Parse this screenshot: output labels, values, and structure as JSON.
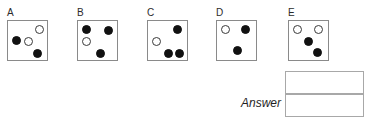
{
  "puzzle": {
    "type": "nonverbal-reasoning-multiple-choice",
    "colors": {
      "black_dot": "#111111",
      "white_dot_fill": "#ffffff",
      "white_dot_stroke": "#3a3a3a",
      "box_border": "#8a8a8a",
      "answer_border": "#a8a8a8",
      "background": "#ffffff",
      "label_text": "#2b2b2b"
    },
    "options": [
      {
        "label": "A",
        "left": 7,
        "dots": [
          {
            "name": "dot-white-top-right",
            "color": "white",
            "x": 27,
            "y": 4
          },
          {
            "name": "dot-black-mid-left",
            "color": "black",
            "x": 4,
            "y": 15
          },
          {
            "name": "dot-white-mid-center",
            "color": "white",
            "x": 16,
            "y": 16
          },
          {
            "name": "dot-black-bottom-right",
            "color": "black",
            "x": 25,
            "y": 28
          }
        ]
      },
      {
        "label": "B",
        "left": 77,
        "dots": [
          {
            "name": "dot-black-top-left",
            "color": "black",
            "x": 4,
            "y": 4
          },
          {
            "name": "dot-black-top-right",
            "color": "black",
            "x": 26,
            "y": 5
          },
          {
            "name": "dot-white-mid-left",
            "color": "white",
            "x": 4,
            "y": 16
          },
          {
            "name": "dot-black-bottom-center",
            "color": "black",
            "x": 18,
            "y": 28
          }
        ]
      },
      {
        "label": "C",
        "left": 147,
        "dots": [
          {
            "name": "dot-black-top-right",
            "color": "black",
            "x": 25,
            "y": 4
          },
          {
            "name": "dot-white-mid-left",
            "color": "white",
            "x": 4,
            "y": 16
          },
          {
            "name": "dot-black-bottom-left",
            "color": "black",
            "x": 16,
            "y": 28
          },
          {
            "name": "dot-black-bottom-right",
            "color": "black",
            "x": 27,
            "y": 28
          }
        ]
      },
      {
        "label": "D",
        "left": 216,
        "dots": [
          {
            "name": "dot-white-top-left",
            "color": "white",
            "x": 4,
            "y": 4
          },
          {
            "name": "dot-black-top-right",
            "color": "black",
            "x": 24,
            "y": 4
          },
          {
            "name": "dot-black-bottom-center",
            "color": "black",
            "x": 16,
            "y": 25
          }
        ]
      },
      {
        "label": "E",
        "left": 288,
        "dots": [
          {
            "name": "dot-white-top-left",
            "color": "white",
            "x": 4,
            "y": 4
          },
          {
            "name": "dot-white-top-right",
            "color": "white",
            "x": 25,
            "y": 4
          },
          {
            "name": "dot-black-center",
            "color": "black",
            "x": 15,
            "y": 16
          },
          {
            "name": "dot-black-bottom-right",
            "color": "black",
            "x": 24,
            "y": 27
          }
        ]
      }
    ]
  },
  "answer": {
    "label": "Answer",
    "box_top_value": "",
    "box_bottom_value": ""
  }
}
